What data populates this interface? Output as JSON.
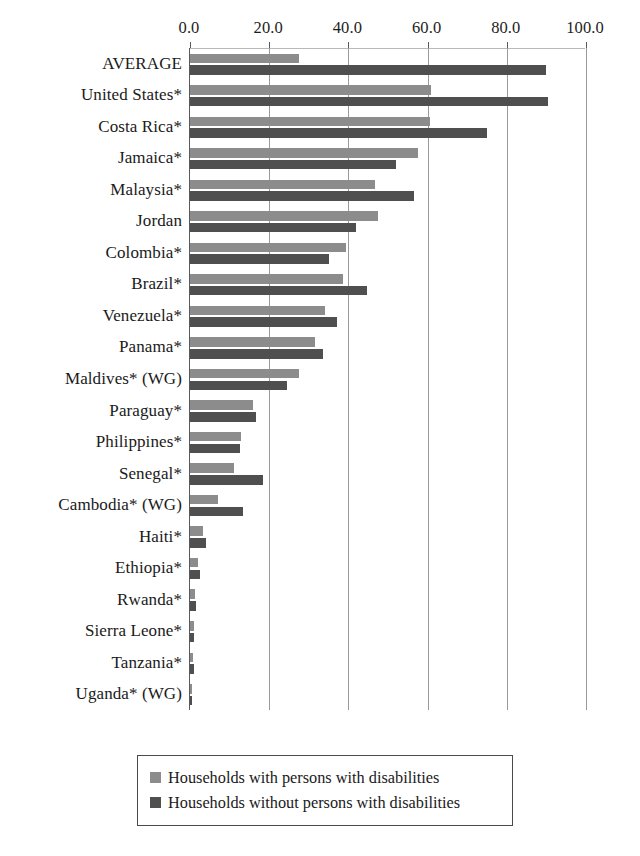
{
  "chart_data": {
    "type": "bar",
    "orientation": "horizontal",
    "title": "",
    "subtitle": "",
    "xlabel": "",
    "ylabel": "",
    "xlim": [
      0.0,
      100.0
    ],
    "xticks": [
      0.0,
      20.0,
      40.0,
      60.0,
      80.0,
      100.0
    ],
    "xtick_labels": [
      "0.0",
      "20.0",
      "40.0",
      "60.0",
      "80.0",
      "100.0"
    ],
    "grid": true,
    "grid_axis": "x",
    "legend_position": "bottom",
    "categories": [
      "AVERAGE",
      "United States*",
      "Costa Rica*",
      "Jamaica*",
      "Malaysia*",
      "Jordan",
      "Colombia*",
      "Brazil*",
      "Venezuela*",
      "Panama*",
      "Maldives* (WG)",
      "Paraguay*",
      "Philippines*",
      "Senegal*",
      "Cambodia* (WG)",
      "Haiti*",
      "Ethiopia*",
      "Rwanda*",
      "Sierra Leone*",
      "Tanzania*",
      "Uganda* (WG)"
    ],
    "series": [
      {
        "name": "Households with persons with disabilities",
        "color": "#8c8c8c",
        "values": [
          27.5,
          60.8,
          60.6,
          57.5,
          46.6,
          47.6,
          39.4,
          38.7,
          34.1,
          31.6,
          27.4,
          15.9,
          13.0,
          11.2,
          7.0,
          3.4,
          2.0,
          1.3,
          1.0,
          0.7,
          0.5
        ]
      },
      {
        "name": "Households without persons with disabilities",
        "color": "#4f4f4f",
        "values": [
          89.9,
          90.5,
          75.0,
          52.0,
          56.6,
          42.0,
          35.2,
          44.7,
          37.0,
          33.6,
          24.6,
          16.6,
          12.6,
          18.5,
          13.5,
          4.0,
          2.6,
          1.6,
          1.1,
          0.9,
          0.6
        ]
      }
    ]
  },
  "legend": {
    "items": [
      {
        "label": "Households with persons with disabilities",
        "color": "#8c8c8c"
      },
      {
        "label": "Households without persons with disabilities",
        "color": "#4f4f4f"
      }
    ]
  }
}
